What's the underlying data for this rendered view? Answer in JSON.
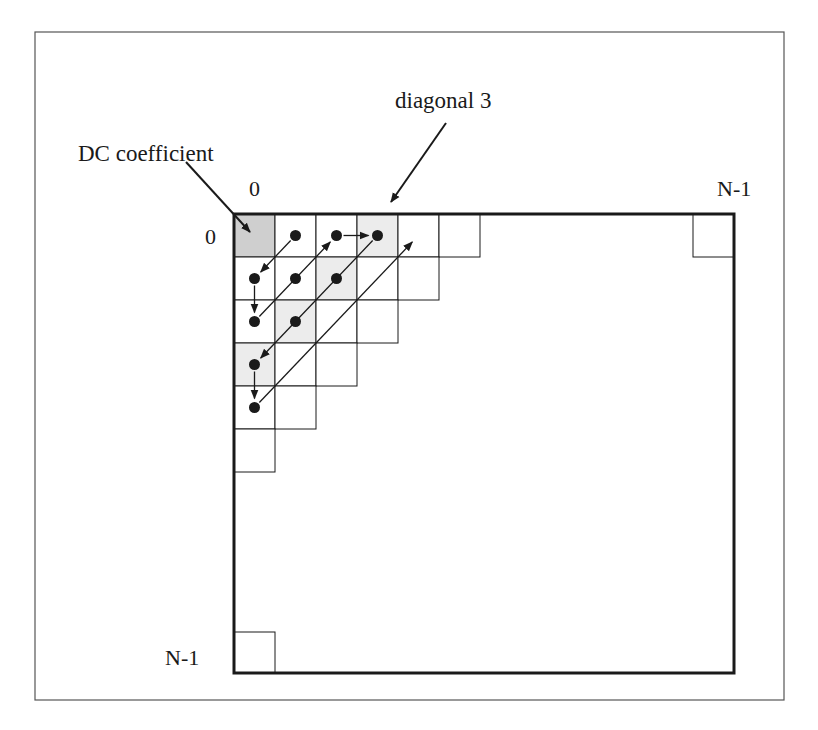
{
  "diagram": {
    "labels": {
      "dc_coefficient": "DC coefficient",
      "diagonal": "diagonal 3",
      "col_start": "0",
      "col_end": "N-1",
      "row_start": "0",
      "row_end": "N-1"
    },
    "colors": {
      "line": "#1a1a1a",
      "frame": "#555555",
      "dc_fill": "#cfcfcf",
      "diagonal_fill": "#ececec",
      "background": "#ffffff"
    },
    "matrix": {
      "size_label": "N x N",
      "staircase_row_lengths": [
        6,
        5,
        4,
        3,
        2,
        1
      ],
      "dc_cell": [
        0,
        0
      ],
      "highlighted_diagonal": 3,
      "corner_cells": [
        [
          0,
          "N-1"
        ],
        [
          "N-1",
          0
        ]
      ]
    },
    "scan": {
      "dots": [
        [
          0,
          1
        ],
        [
          1,
          0
        ],
        [
          2,
          0
        ],
        [
          1,
          1
        ],
        [
          0,
          2
        ],
        [
          0,
          3
        ],
        [
          1,
          2
        ],
        [
          2,
          1
        ],
        [
          3,
          0
        ],
        [
          4,
          0
        ]
      ],
      "arrows": [
        {
          "from": [
            0,
            1
          ],
          "to": [
            1,
            0
          ]
        },
        {
          "from": [
            1,
            0
          ],
          "to": [
            2,
            0
          ]
        },
        {
          "from": [
            2,
            0
          ],
          "to": [
            0,
            2
          ]
        },
        {
          "from": [
            0,
            2
          ],
          "to": [
            0,
            3
          ]
        },
        {
          "from": [
            0,
            3
          ],
          "to": [
            3,
            0
          ]
        },
        {
          "from": [
            3,
            0
          ],
          "to": [
            4,
            0
          ]
        },
        {
          "from": [
            4,
            0
          ],
          "to": [
            0,
            4
          ]
        }
      ]
    }
  }
}
